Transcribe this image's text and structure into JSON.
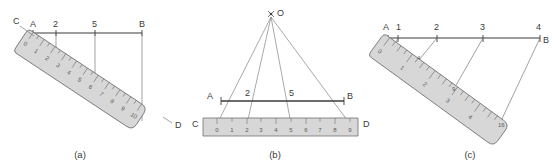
{
  "figure": {
    "background_color": "#ffffff",
    "ink_color": "#3b3b3b",
    "ruler_fill": "#d7d7d7",
    "ruler_stroke": "#6e6e6e",
    "thin_line_color": "#7a7a7a"
  },
  "panels": [
    {
      "id": "a",
      "caption": "(a)",
      "baseline": {
        "start_label": "A",
        "end_label": "B",
        "tick_labels": [
          "2",
          "5"
        ]
      },
      "ruler": {
        "near_end_label": "C",
        "far_end_label": "D",
        "orientation": "diagonal-down-right",
        "numbers": [
          "0",
          "1",
          "2",
          "3",
          "4",
          "5",
          "6",
          "7",
          "8",
          "9",
          "10"
        ],
        "max": 10
      },
      "projection_marks": [
        "0",
        "2",
        "5",
        "10"
      ]
    },
    {
      "id": "b",
      "caption": "(b)",
      "apex_label": "O",
      "baseline": {
        "start_label": "A",
        "end_label": "B",
        "tick_labels": [
          "2",
          "5"
        ]
      },
      "ruler": {
        "near_end_label": "C",
        "far_end_label": "D",
        "orientation": "horizontal",
        "numbers": [
          "0",
          "1",
          "2",
          "3",
          "4",
          "5",
          "6",
          "7",
          "8",
          "9"
        ],
        "max": 9
      },
      "rays": [
        "0",
        "2",
        "5",
        "9"
      ]
    },
    {
      "id": "c",
      "caption": "(c)",
      "baseline": {
        "start_label": "A",
        "end_label": "B",
        "tick_labels": [
          "1",
          "2",
          "3",
          "4"
        ]
      },
      "ruler": {
        "orientation": "diagonal-down-right",
        "numbers": [
          "0",
          "1",
          "2",
          "3",
          "4"
        ],
        "max": 4
      },
      "projection_marks": [
        "4",
        "9",
        "16"
      ]
    }
  ]
}
